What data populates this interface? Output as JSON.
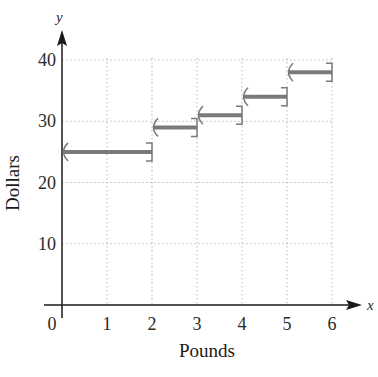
{
  "chart_data": {
    "type": "step",
    "title": "",
    "xlabel": "Pounds",
    "ylabel": "Dollars",
    "x_axis_var": "x",
    "y_axis_var": "y",
    "xlim": [
      0,
      6
    ],
    "ylim": [
      0,
      40
    ],
    "x_ticks": [
      "0",
      "1",
      "2",
      "3",
      "4",
      "5",
      "6"
    ],
    "y_ticks": [
      "10",
      "20",
      "30",
      "40"
    ],
    "grid": true,
    "segments": [
      {
        "x_start": 0,
        "x_end": 2,
        "y": 25,
        "left": "open",
        "right": "closed"
      },
      {
        "x_start": 2,
        "x_end": 3,
        "y": 29,
        "left": "open",
        "right": "closed"
      },
      {
        "x_start": 3,
        "x_end": 4,
        "y": 31,
        "left": "open",
        "right": "closed"
      },
      {
        "x_start": 4,
        "x_end": 5,
        "y": 34,
        "left": "open",
        "right": "closed"
      },
      {
        "x_start": 5,
        "x_end": 6,
        "y": 38,
        "left": "open",
        "right": "closed"
      }
    ],
    "colors": {
      "segment": "#7a7a7a",
      "axis": "#1a1a1a",
      "grid": "#b8b8b8"
    }
  }
}
